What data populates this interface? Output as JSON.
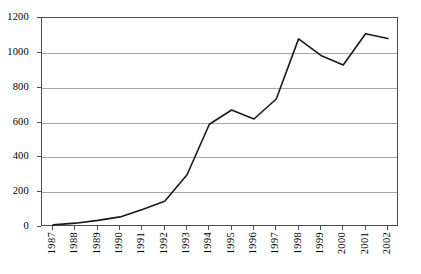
{
  "chart_data": {
    "type": "line",
    "title": "",
    "subtitle": "",
    "xlabel": "",
    "ylabel": "",
    "categories": [
      "1987",
      "1988",
      "1989",
      "1990",
      "1991",
      "1992",
      "1993",
      "1994",
      "1995",
      "1996",
      "1997",
      "1998",
      "1999",
      "2000",
      "2001",
      "2002"
    ],
    "values": [
      12,
      22,
      38,
      58,
      100,
      148,
      300,
      590,
      672,
      620,
      735,
      1080,
      985,
      930,
      1110,
      1082
    ],
    "series": [
      {
        "name": "",
        "values": [
          12,
          22,
          38,
          58,
          100,
          148,
          300,
          590,
          672,
          620,
          735,
          1080,
          985,
          930,
          1110,
          1082
        ]
      }
    ],
    "ylim": [
      0,
      1200
    ],
    "ytick_labels": [
      "0",
      "200",
      "400",
      "600",
      "800",
      "1000",
      "1200"
    ],
    "ytick_values": [
      0,
      200,
      400,
      600,
      800,
      1000,
      1200
    ],
    "xtick_labels": [
      "1987",
      "1988",
      "1989",
      "1990",
      "1991",
      "1992",
      "1993",
      "1994",
      "1995",
      "1996",
      "1997",
      "1998",
      "1999",
      "2000",
      "2001",
      "2002"
    ],
    "grid": true,
    "grid_axis": "y",
    "legend": false,
    "legend_position": "none",
    "line_color": "#1a1a1a",
    "grid_color": "#a6a6a6",
    "frame_color": "#4d4d4d",
    "background_color": "#ffffff",
    "annotations": []
  }
}
